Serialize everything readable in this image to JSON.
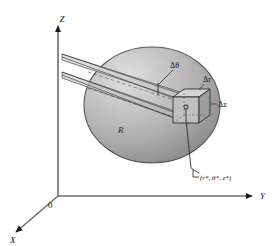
{
  "figure": {
    "background_color": "#ffffff",
    "ink_color": "#1a1a1a"
  },
  "axes": {
    "z_label": "Z",
    "y_label": "Y",
    "x_label": "X",
    "origin_label": "0"
  },
  "labels": {
    "delta_theta": "Δθ",
    "delta_r": "Δr",
    "delta_z": "Δz",
    "region": "R",
    "point_coords": "(r*, θ*, z*)"
  },
  "colors": {
    "sphere_light": "#d8d8d8",
    "sphere_mid": "#b4b4b4",
    "sphere_dark": "#8d8d8d",
    "sphere_edge": "#5a5a5a",
    "wedge_fill": "#cfcfcf",
    "cube_top": "#d2d2d2",
    "cube_left": "#bdbdbd",
    "cube_right": "#9a9a9a",
    "cube_edge": "#2f2f2f",
    "ray_line": "#3a3a3a",
    "axis_line": "#6d6d6d"
  },
  "geometry": {
    "sphere": {
      "cx": 152,
      "cy": 105,
      "rx": 68,
      "ry": 58
    },
    "cube": {
      "x": 173,
      "y": 97,
      "w": 26,
      "h": 26,
      "depth": 11
    },
    "origin": {
      "x": 58,
      "y": 196
    }
  }
}
